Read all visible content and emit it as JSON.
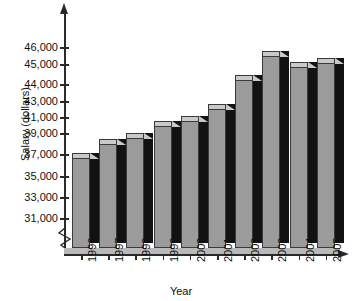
{
  "chart_data": {
    "type": "bar",
    "title": "",
    "xlabel": "Year",
    "ylabel": "Salary (dollars)",
    "categories": [
      "1996",
      "1997",
      "1998",
      "1999",
      "2000",
      "2001",
      "2002",
      "2003",
      "2004",
      "2005"
    ],
    "values": [
      37200,
      38500,
      39100,
      40600,
      41300,
      42700,
      44500,
      45800,
      45200,
      45400
    ],
    "ytick_labels": [
      "31,000",
      "33,000",
      "35,000",
      "37,000",
      "39,000",
      "41,000",
      "43,000",
      "44,000",
      "45,000",
      "46,000"
    ],
    "ytick_values": [
      31000,
      33000,
      35000,
      37000,
      39000,
      41000,
      43000,
      44000,
      45000,
      46000
    ],
    "ylim": [
      30500,
      46500
    ],
    "grid": false,
    "legend": null,
    "axis_break": true,
    "style": "3d-bars-grayscale",
    "bar_face_color": "#9b9b9b",
    "bar_top_color": "#c9c9c9",
    "bar_side_color": "#121212",
    "axis_color": "#2a2a2a"
  }
}
